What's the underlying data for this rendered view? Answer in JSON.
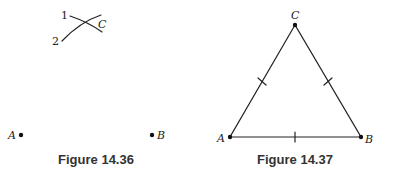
{
  "figures": [
    {
      "caption": "Figure 14.36",
      "arc_labels": [
        "1",
        "2"
      ],
      "intersection_label": "C",
      "points": [
        {
          "label": "A"
        },
        {
          "label": "B"
        }
      ]
    },
    {
      "caption": "Figure 14.37",
      "vertices": [
        {
          "label": "C"
        },
        {
          "label": "A"
        },
        {
          "label": "B"
        }
      ],
      "note": "equilateral triangle with congruence tick marks on all three sides"
    }
  ]
}
